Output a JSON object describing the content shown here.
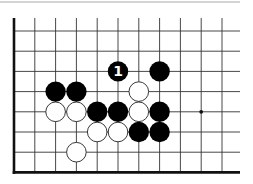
{
  "diagram": {
    "type": "go-board-fragment",
    "colors": {
      "background": "#ffffff",
      "grid": "#333333",
      "edge": "#111111",
      "separator": "#aaaaaa",
      "black_stone": "#000000",
      "white_stone": "#ffffff",
      "white_stone_outline": "#222222",
      "label_on_black": "#ffffff"
    },
    "grid": {
      "columns_x": [
        14,
        34.8,
        55.6,
        76.4,
        97.2,
        118,
        138.8,
        159.6,
        180.4,
        201.2,
        222
      ],
      "rows_y": [
        31,
        51.2,
        71.4,
        91.6,
        111.8,
        132,
        152.2,
        172.4
      ],
      "left_edge": true,
      "bottom_edge": true,
      "top_edge": false,
      "right_edge": false
    },
    "stones": [
      {
        "color": "black",
        "col": 5,
        "row": 2,
        "label": "1"
      },
      {
        "color": "black",
        "col": 7,
        "row": 2,
        "label": ""
      },
      {
        "color": "black",
        "col": 2,
        "row": 3,
        "label": ""
      },
      {
        "color": "black",
        "col": 3,
        "row": 3,
        "label": ""
      },
      {
        "color": "white",
        "col": 6,
        "row": 3,
        "label": ""
      },
      {
        "color": "white",
        "col": 2,
        "row": 4,
        "label": ""
      },
      {
        "color": "white",
        "col": 3,
        "row": 4,
        "label": ""
      },
      {
        "color": "black",
        "col": 4,
        "row": 4,
        "label": ""
      },
      {
        "color": "black",
        "col": 5,
        "row": 4,
        "label": ""
      },
      {
        "color": "white",
        "col": 6,
        "row": 4,
        "label": ""
      },
      {
        "color": "black",
        "col": 7,
        "row": 4,
        "label": ""
      },
      {
        "color": "white",
        "col": 4,
        "row": 5,
        "label": ""
      },
      {
        "color": "white",
        "col": 5,
        "row": 5,
        "label": ""
      },
      {
        "color": "black",
        "col": 6,
        "row": 5,
        "label": ""
      },
      {
        "color": "black",
        "col": 7,
        "row": 5,
        "label": ""
      },
      {
        "color": "white",
        "col": 3,
        "row": 6,
        "label": ""
      }
    ],
    "star_points": [
      {
        "col": 9,
        "row": 4
      }
    ],
    "move_label": "1"
  }
}
